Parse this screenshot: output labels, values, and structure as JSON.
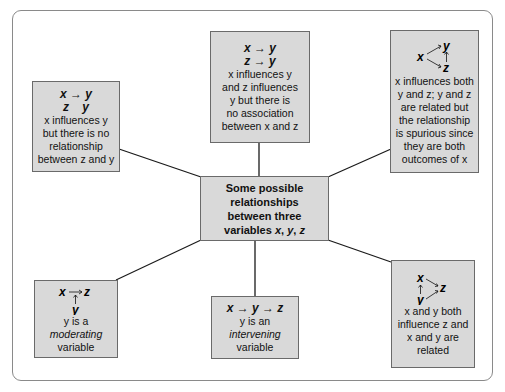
{
  "diagram": {
    "center": {
      "lines": [
        "Some possible",
        "relationships",
        "between three",
        "variables"
      ],
      "vars": [
        "x",
        "y",
        "z"
      ]
    },
    "boxes": [
      {
        "id": "no-relationship-z-y",
        "formula_lines": [
          "x → y",
          "z    y"
        ],
        "description_lines": [
          "x influences y",
          "but there is no",
          "relationship",
          "between z and y"
        ]
      },
      {
        "id": "independent-influences",
        "formula_lines": [
          "x → y",
          "z → y"
        ],
        "description_lines": [
          "x influences y",
          "and z influences",
          "y but there is",
          "no association",
          "between x and z"
        ]
      },
      {
        "id": "spurious",
        "formula_labels": {
          "x": "x",
          "y": "y",
          "z": "z"
        },
        "description_lines": [
          "x influences both",
          "y and z; y and z",
          "are related but",
          "the relationship",
          "is spurious since",
          "they are both",
          "outcomes of x"
        ]
      },
      {
        "id": "moderating",
        "formula_labels": {
          "x": "x",
          "y": "y",
          "z": "z"
        },
        "description_lines": [
          "y is a",
          "moderating",
          "variable"
        ]
      },
      {
        "id": "intervening",
        "formula_lines": [
          "x → y → z"
        ],
        "description_lines": [
          "y is an",
          "intervening",
          "variable"
        ]
      },
      {
        "id": "both-influence",
        "formula_labels": {
          "x": "x",
          "y": "y",
          "z": "z"
        },
        "description_lines": [
          "x and y both",
          "influence z and",
          "x and y are",
          "related"
        ]
      }
    ],
    "colors": {
      "box_fill": "#d9d9d9",
      "box_border": "#6a6a6a",
      "line": "#1a1a1a",
      "frame": "#8a8a8a"
    }
  }
}
